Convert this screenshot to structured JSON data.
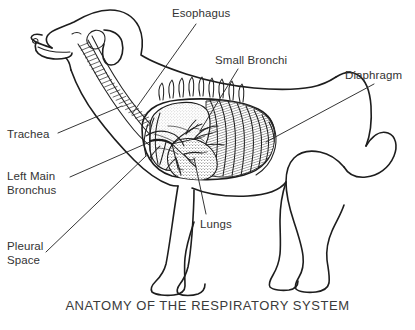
{
  "figure": {
    "title": "ANATOMY OF THE RESPIRATORY SYSTEM",
    "background_color": "#ffffff",
    "ink_color": "#1d1d1d",
    "text_color": "#333333"
  },
  "labels": {
    "esophagus": "Esophagus",
    "small_bronchi": "Small Bronchi",
    "diaphragm": "Diaphragm",
    "trachea": "Trachea",
    "left_main_bronchus_line1": "Left Main",
    "left_main_bronchus_line2": "Bronchus",
    "pleural_space_line1": "Pleural",
    "pleural_space_line2": "Space",
    "lungs": "Lungs"
  },
  "label_list": [
    {
      "id": "esophagus",
      "text": "Esophagus",
      "side": "right",
      "x": 172,
      "y": 7
    },
    {
      "id": "small-bronchi",
      "text": "Small Bronchi",
      "side": "right",
      "x": 215,
      "y": 54
    },
    {
      "id": "diaphragm",
      "text": "Diaphragm",
      "side": "right",
      "x": 345,
      "y": 69
    },
    {
      "id": "trachea",
      "text": "Trachea",
      "side": "left",
      "x": 7,
      "y": 128
    },
    {
      "id": "left-main-bronchus",
      "text": "Left Main Bronchus",
      "side": "left",
      "x": 7,
      "y": 170
    },
    {
      "id": "pleural-space",
      "text": "Pleural Space",
      "side": "left",
      "x": 7,
      "y": 240
    },
    {
      "id": "lungs",
      "text": "Lungs",
      "side": "bottom",
      "x": 200,
      "y": 218
    }
  ]
}
